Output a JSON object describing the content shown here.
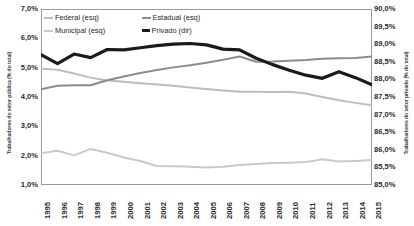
{
  "chart_data": {
    "type": "line",
    "title": "",
    "xlabel": "",
    "ylabel": "Trabalhadores do setor pública (% do total)",
    "ylabel_right": "Trabalhadores do setor privado (% do total)",
    "x": [
      "1995",
      "1996",
      "1997",
      "1998",
      "1999",
      "2000",
      "2001",
      "2002",
      "2003",
      "2004",
      "2005",
      "2006",
      "2007",
      "2008",
      "2009",
      "2010",
      "2011",
      "2012",
      "2013",
      "2014",
      "2015"
    ],
    "ylim": [
      1.0,
      7.0
    ],
    "ylim_right": [
      85.0,
      90.0
    ],
    "yticks": [
      "1,0%",
      "2,0%",
      "3,0%",
      "4,0%",
      "5,0%",
      "6,0%",
      "7,0%"
    ],
    "yticks_right": [
      "85,0%",
      "85,5%",
      "86,0%",
      "86,5%",
      "87,0%",
      "87,5%",
      "88,0%",
      "88,5%",
      "89,0%",
      "89,5%",
      "90,0%"
    ],
    "grid": false,
    "legend_position": "top-left",
    "series": [
      {
        "name": "Federal (esq)",
        "axis": "left",
        "color": "#bdbdbd",
        "width": 2.0,
        "values": [
          4.96,
          4.93,
          4.8,
          4.66,
          4.56,
          4.52,
          4.47,
          4.43,
          4.38,
          4.32,
          4.27,
          4.22,
          4.18,
          4.18,
          4.17,
          4.18,
          4.12,
          4.0,
          3.89,
          3.8,
          3.72
        ]
      },
      {
        "name": "Estadual (esq)",
        "axis": "left",
        "color": "#8c8c8c",
        "width": 2.0,
        "values": [
          4.26,
          4.38,
          4.4,
          4.4,
          4.57,
          4.7,
          4.82,
          4.92,
          5.01,
          5.08,
          5.17,
          5.27,
          5.38,
          5.2,
          5.21,
          5.24,
          5.26,
          5.3,
          5.32,
          5.33,
          5.38
        ]
      },
      {
        "name": "Municipal (esq)",
        "axis": "left",
        "color": "#c9c9c9",
        "width": 2.0,
        "values": [
          2.08,
          2.17,
          2.01,
          2.23,
          2.1,
          1.94,
          1.82,
          1.65,
          1.64,
          1.62,
          1.6,
          1.62,
          1.68,
          1.72,
          1.75,
          1.76,
          1.78,
          1.88,
          1.8,
          1.82,
          1.85
        ]
      },
      {
        "name": "Privado (dir)",
        "axis": "right",
        "color": "#1a1a1a",
        "width": 3.2,
        "values": [
          88.7,
          88.45,
          88.72,
          88.62,
          88.85,
          88.84,
          88.9,
          88.96,
          89.0,
          89.02,
          88.98,
          88.86,
          88.84,
          88.6,
          88.42,
          88.26,
          88.12,
          88.03,
          88.22,
          88.05,
          87.85
        ]
      }
    ]
  }
}
